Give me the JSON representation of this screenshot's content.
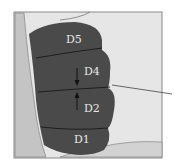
{
  "diagram": {
    "regions": [
      {
        "id": "D5",
        "label": "D5"
      },
      {
        "id": "D4",
        "label": "D4"
      },
      {
        "id": "D2",
        "label": "D2"
      },
      {
        "id": "D1",
        "label": "D1"
      }
    ],
    "colors": {
      "frame_bg": "#e6e6e6",
      "left_strip": "#c4c4c4",
      "region_fill": "#4a4a4a",
      "divider": "#1e1e1e",
      "label": "#e8e8e8"
    }
  }
}
